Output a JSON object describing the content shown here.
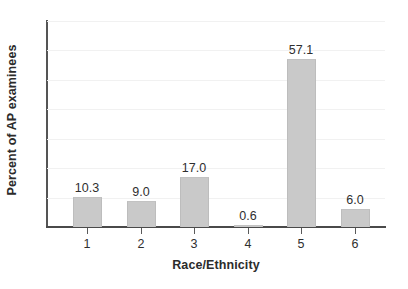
{
  "chart_data": {
    "type": "bar",
    "title": "",
    "subtitle": "",
    "xlabel": "Race/Ethnicity",
    "ylabel": "Percent of AP examinees",
    "categories": [
      "1",
      "2",
      "3",
      "4",
      "5",
      "6"
    ],
    "values": [
      10.3,
      9.0,
      17.0,
      0.6,
      57.1,
      6.0
    ],
    "data_labels": [
      "10.3",
      "9.0",
      "17.0",
      "0.6",
      "57.1",
      "6.0"
    ],
    "ylim": [
      0,
      70
    ],
    "xtick_labels": [
      "1",
      "2",
      "3",
      "4",
      "5",
      "6"
    ],
    "ytick_labels": [],
    "grid": "horizontal-faint",
    "legend": "none",
    "colors": {
      "bar_fill": "#c9c9c9",
      "bar_edge": "#bdbdbd",
      "axis": "#4a4a4a",
      "gridline": "#f1f1f1",
      "text": "#2f2f2f",
      "background": "#ffffff"
    },
    "gridline_values": [
      10,
      20,
      30,
      40,
      50,
      60,
      70
    ]
  }
}
